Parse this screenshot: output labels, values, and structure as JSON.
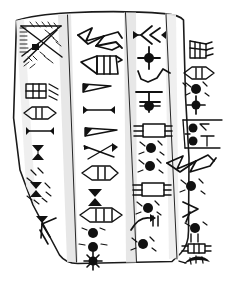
{
  "figure": {
    "kind": "line-drawing",
    "background_color": "#ffffff",
    "ink_color": "#111111",
    "outline_color": "#1a1a1a",
    "column_shade_color": "#e3e3e3",
    "top_caption": "",
    "canvas": {
      "width": 233,
      "height": 289
    }
  },
  "tablet": {
    "label": "clay tablet",
    "outline_points": "16,19 48,14 104,11 160,12 183,18 186,96 190,160 189,232 182,252 172,262 74,264 58,258 22,188 13,120",
    "columns": [
      {
        "id": "column-1",
        "label": "Column 1 (leftmost)",
        "sign_count": 8
      },
      {
        "id": "column-2",
        "label": "Column 2",
        "sign_count": 9
      },
      {
        "id": "column-3",
        "label": "Column 3",
        "sign_count": 9
      },
      {
        "id": "column-4",
        "label": "Column 4 (rightmost, narrow edge)",
        "sign_count": 9
      }
    ]
  },
  "signs": {
    "column_1": [
      {
        "id": "c1-s1",
        "name": "hatched-triangle-with-dot-sign",
        "note": "large rayed triangle with comb hatching and solid square dot"
      },
      {
        "id": "c1-s2",
        "name": "ladder-box-sign",
        "note": "rectangle with internal cross bars plus three short strokes"
      },
      {
        "id": "c1-s3",
        "name": "pointed-oval-with-bars-sign",
        "note": "lens/boat shape with two inner verticals"
      },
      {
        "id": "c1-s4",
        "name": "barbell-line-sign",
        "note": "horizontal line capped by wedges at both ends"
      },
      {
        "id": "c1-s5",
        "name": "hourglass-sign",
        "note": "double-triangle bowtie mark"
      },
      {
        "id": "c1-s6",
        "name": "wedge-cluster-sign",
        "note": "scattered short tick strokes"
      },
      {
        "id": "c1-s7",
        "name": "hourglass-with-ticks-sign",
        "note": "bowtie flanked by tick strokes"
      },
      {
        "id": "c1-s8",
        "name": "arrow-chevron-sign",
        "note": "filled wedge above open chevron near lower edge"
      }
    ],
    "column_2": [
      {
        "id": "c2-s1",
        "name": "bird-zigzag-sign",
        "note": "angular bird-like zigzag glyph spanning column width"
      },
      {
        "id": "c2-s2",
        "name": "pennant-box-sign",
        "note": "triangle joined to a divided rectangle with tail"
      },
      {
        "id": "c2-s3",
        "name": "tapered-bar-sign",
        "note": "wedge-headed tapering horizontal bar"
      },
      {
        "id": "c2-s4",
        "name": "barbell-line-sign",
        "note": "horizontal line capped by wedges"
      },
      {
        "id": "c2-s5",
        "name": "long-tapered-bar-sign",
        "note": "long narrow wedge-headed bar"
      },
      {
        "id": "c2-s6",
        "name": "crossed-wedges-sign",
        "note": "two crossing tapered strokes"
      },
      {
        "id": "c2-s7",
        "name": "oval-with-bars-sign",
        "note": "lens shape containing two vertical strokes"
      },
      {
        "id": "c2-s8",
        "name": "hourglass-sign",
        "note": "bowtie mark"
      },
      {
        "id": "c2-s9",
        "name": "segmented-oval-with-dots-sign",
        "note": "divided lens above two impressed round dots and a star-dot"
      }
    ],
    "column_3": [
      {
        "id": "c3-s1",
        "name": "double-chevron-barbell-sign",
        "note": "nested chevrons between two end wedges"
      },
      {
        "id": "c3-s2",
        "name": "star-dot-sign",
        "note": "impressed round dot with four radiating spikes"
      },
      {
        "id": "c3-s3",
        "name": "wavy-line-sign",
        "note": "low undulating water line"
      },
      {
        "id": "c3-s4",
        "name": "cross-bar-star-sign",
        "note": "T-bar above a star-dot"
      },
      {
        "id": "c3-s5",
        "name": "ruled-box-sign",
        "note": "rectangle flanked by paired horizontal strokes"
      },
      {
        "id": "c3-s6",
        "name": "rayed-dot-pair-sign",
        "note": "two impressed dots each with radiating ticks"
      },
      {
        "id": "c3-s7",
        "name": "ruled-box-sign",
        "note": "second rectangle flanked by horizontal strokes"
      },
      {
        "id": "c3-s8",
        "name": "rayed-dot-sign",
        "note": "impressed dot with radiating ticks"
      },
      {
        "id": "c3-s9",
        "name": "hook-and-dot-sign",
        "note": "curved hook stroke beside a rayed dot"
      }
    ],
    "column_4": [
      {
        "id": "c4-s1",
        "name": "comb-box-sign",
        "note": "small box with comb teeth at top edge"
      },
      {
        "id": "c4-s2",
        "name": "lens-with-bars-sign",
        "note": "pointed oval with vertical bars"
      },
      {
        "id": "c4-s3",
        "name": "rayed-dot-and-star-sign",
        "note": "impressed dot with rays above a star-dot"
      },
      {
        "id": "c4-s4",
        "name": "dot-pair-with-tee-sign",
        "note": "two dots beside a T-shaped stroke inside a ruled panel"
      },
      {
        "id": "c4-s5",
        "name": "bird-zigzag-sign",
        "note": "angular bird-like zigzag glyph"
      },
      {
        "id": "c4-s6",
        "name": "rayed-dot-sign",
        "note": "impressed dot with radiating ticks"
      },
      {
        "id": "c4-s7",
        "name": "arrow-chevron-sign",
        "note": "open chevron with tick"
      },
      {
        "id": "c4-s8",
        "name": "dot-with-rays-sign",
        "note": "dot with rays over two short verticals"
      },
      {
        "id": "c4-s9",
        "name": "ruled-box-sign",
        "note": "small divided rectangle"
      },
      {
        "id": "c4-s10",
        "name": "fan-arc-sign",
        "note": "filled arc / fan shape at bottom edge"
      }
    ]
  }
}
